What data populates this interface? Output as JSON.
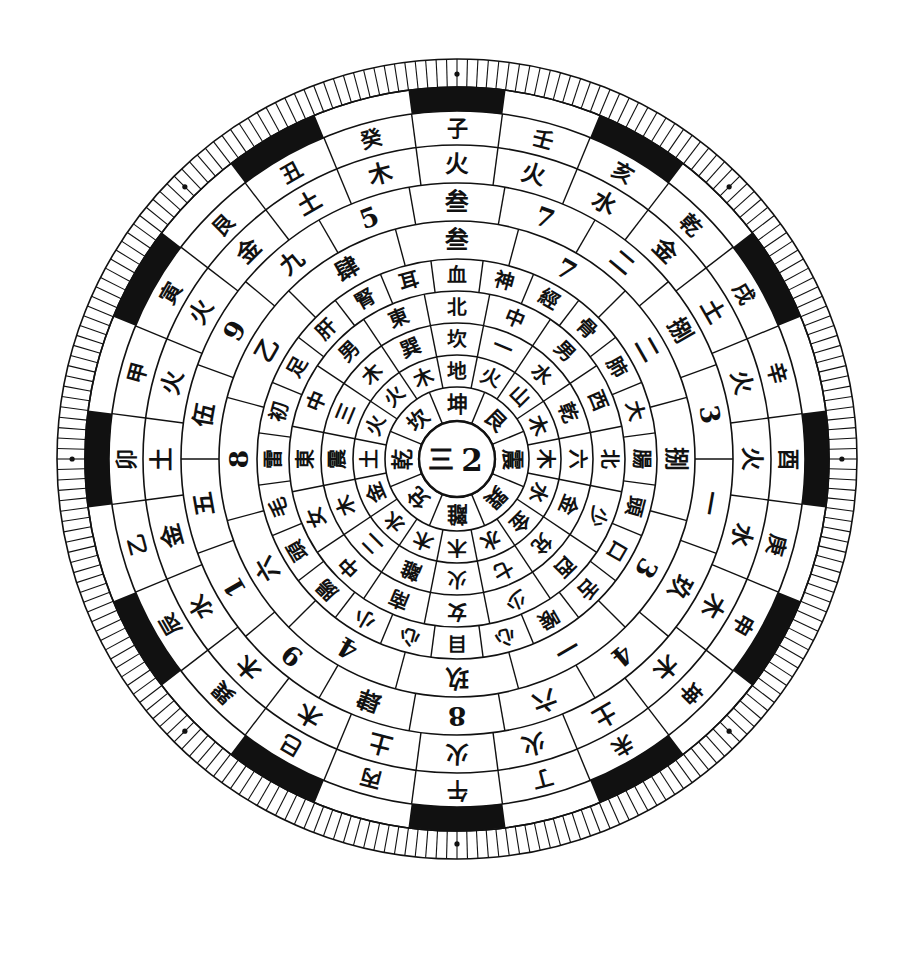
{
  "figure": {
    "center_label_left": "三",
    "center_label_right": "2",
    "geometry": {
      "cx": 457,
      "cy": 459,
      "outer_radius": 400,
      "ring_radii": [
        38,
        72,
        104,
        136,
        168,
        200,
        238,
        276,
        314,
        348,
        372,
        400
      ]
    },
    "colors": {
      "ink": "#111111",
      "paper": "#ffffff"
    }
  },
  "rings": [
    {
      "name": "ring-1-trigrams",
      "index": 1,
      "sectors": 8,
      "start_angle": -22.5,
      "r_inner": 38,
      "r_outer": 72,
      "orientation": "radial",
      "cells": [
        "坤",
        "艮",
        "震",
        "巽",
        "離",
        "兌",
        "乾",
        "坎"
      ]
    },
    {
      "name": "ring-2-elements",
      "index": 2,
      "sectors": 16,
      "start_angle": -11.25,
      "r_inner": 72,
      "r_outer": 104,
      "orientation": "radial",
      "cells": [
        "地",
        "火",
        "山",
        "木",
        "木",
        "水",
        "金",
        "水",
        "木",
        "木",
        "水",
        "金",
        "土",
        "火",
        "火",
        "木"
      ]
    },
    {
      "name": "ring-3-directions",
      "index": 3,
      "sectors": 16,
      "start_angle": -11.25,
      "r_inner": 104,
      "r_outer": 136,
      "orientation": "radial",
      "cells": [
        "坎",
        "一",
        "水",
        "乾",
        "六",
        "金",
        "兌",
        "七",
        "火",
        "離",
        "二",
        "木",
        "震",
        "三",
        "木",
        "巽"
      ]
    },
    {
      "name": "ring-4-positions",
      "index": 4,
      "sectors": 16,
      "start_angle": -11.25,
      "r_inner": 136,
      "r_outer": 168,
      "orientation": "radial",
      "cells": [
        "北",
        "中",
        "男",
        "西",
        "北",
        "少",
        "西",
        "少",
        "女",
        "南",
        "中",
        "女",
        "東",
        "中",
        "男",
        "東"
      ]
    },
    {
      "name": "ring-5-body",
      "index": 5,
      "sectors": 24,
      "start_angle": -7.5,
      "r_inner": 168,
      "r_outer": 200,
      "orientation": "radial",
      "cells": [
        "血",
        "神",
        "經",
        "骨",
        "肺",
        "大",
        "腸",
        "頭",
        "口",
        "舌",
        "喉",
        "心",
        "目",
        "心",
        "小",
        "腸",
        "頭",
        "毛",
        "雷",
        "初",
        "足",
        "肝",
        "腎",
        "耳"
      ]
    },
    {
      "name": "ring-6-numbers",
      "index": 6,
      "sectors": 12,
      "start_angle": -15,
      "r_inner": 200,
      "r_outer": 238,
      "orientation": "upright",
      "cells": [
        "叁",
        "7",
        "二",
        "捌",
        "3",
        "一",
        "玖",
        "4",
        "六",
        "8",
        "乙",
        "肆",
        "9",
        "1",
        "五",
        "伍",
        "9",
        "九"
      ]
    },
    {
      "name": "ring-7-numbers-visible",
      "index": 7,
      "sectors": 18,
      "start_angle": -10,
      "r_inner": 238,
      "r_outer": 276,
      "orientation": "upright",
      "numbers": [
        "叁",
        "7",
        "二",
        "捌",
        "3",
        "一",
        "玖",
        "4",
        "六",
        "8",
        "肆",
        "9",
        "1",
        "五",
        "伍",
        "9",
        "九",
        "5",
        "七"
      ]
    },
    {
      "name": "ring-8-elements-outer",
      "index": 8,
      "sectors": 24,
      "start_angle": -7.5,
      "r_inner": 276,
      "r_outer": 314,
      "orientation": "upright",
      "cells": [
        "火",
        "火",
        "水",
        "金",
        "土",
        "火",
        "火",
        "水",
        "木",
        "木",
        "土",
        "火",
        "火",
        "土",
        "木",
        "木",
        "水",
        "金",
        "土",
        "火",
        "火",
        "金",
        "土",
        "木"
      ]
    },
    {
      "name": "ring-9-stems-branches",
      "index": 9,
      "sectors": 24,
      "start_angle": -7.5,
      "r_inner": 314,
      "r_outer": 348,
      "orientation": "upright",
      "cells": [
        "子",
        "壬",
        "亥",
        "乾",
        "戌",
        "辛",
        "酉",
        "庚",
        "申",
        "坤",
        "未",
        "丁",
        "午",
        "丙",
        "巳",
        "巽",
        "辰",
        "乙",
        "卯",
        "甲",
        "寅",
        "艮",
        "丑",
        "癸"
      ]
    },
    {
      "name": "ring-10-black-white-segments",
      "index": 10,
      "sectors": 24,
      "r_inner": 348,
      "r_outer": 372,
      "pattern": "alternating black and white arcs"
    },
    {
      "name": "ring-11-ticks",
      "index": 11,
      "sectors": 240,
      "r_inner": 372,
      "r_outer": 400,
      "pattern": "fine radial graduation ticks with 8 registration dots"
    }
  ],
  "ring_contents": {
    "trigram_ring": [
      "坤",
      "艮",
      "震",
      "巽",
      "離",
      "兌",
      "乾",
      "坎"
    ],
    "element_ring": [
      "地",
      "火",
      "山",
      "木",
      "木",
      "水",
      "金",
      "水",
      "木",
      "木",
      "水",
      "金",
      "土",
      "火",
      "火",
      "木"
    ],
    "direction_ring": [
      "坎",
      "一",
      "水",
      "乾",
      "六",
      "金",
      "兌",
      "七",
      "火",
      "離",
      "二",
      "木",
      "震",
      "三",
      "木",
      "巽"
    ],
    "position_ring": [
      "北",
      "中",
      "男",
      "西",
      "北",
      "少",
      "西",
      "少",
      "女",
      "南",
      "中",
      "女",
      "東",
      "中",
      "男",
      "東"
    ],
    "body_ring": [
      "血",
      "神",
      "經",
      "骨",
      "肺",
      "大",
      "腸",
      "頭",
      "口",
      "舌",
      "喉",
      "心",
      "目",
      "心",
      "小",
      "腸",
      "頭",
      "毛",
      "雷",
      "初",
      "足",
      "肝",
      "腎",
      "耳"
    ],
    "number_ring_arabic": [
      "7",
      "3",
      "4",
      "8",
      "9",
      "1",
      "5"
    ],
    "number_ring_chinese": [
      "叁",
      "二",
      "捌",
      "一",
      "玖",
      "六",
      "肆",
      "五",
      "伍",
      "九",
      "七"
    ],
    "outer_element_ring": [
      "火",
      "火",
      "水",
      "金",
      "土",
      "火",
      "火",
      "水",
      "木",
      "木",
      "土",
      "火",
      "火",
      "土",
      "木",
      "木",
      "水",
      "金",
      "土",
      "火",
      "火",
      "金",
      "土",
      "木"
    ],
    "stem_branch_ring": [
      "子",
      "壬",
      "亥",
      "乾",
      "戌",
      "辛",
      "酉",
      "庚",
      "申",
      "坤",
      "未",
      "丁",
      "午",
      "丙",
      "巳",
      "巽",
      "辰",
      "乙",
      "卯",
      "甲",
      "寅",
      "艮",
      "丑",
      "癸"
    ]
  }
}
